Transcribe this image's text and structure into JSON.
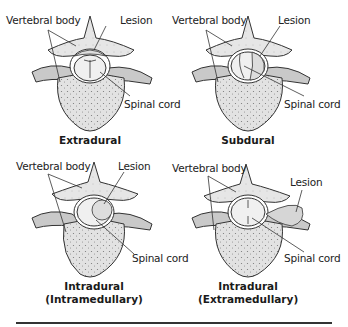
{
  "figure": {
    "panels": [
      {
        "id": "extradural",
        "caption": "Extradural",
        "caption2": "",
        "labels": {
          "vertebral_body": "Vertebral body",
          "lesion": "Lesion",
          "spinal_cord": "Spinal cord"
        }
      },
      {
        "id": "subdural",
        "caption": "Subdural",
        "caption2": "",
        "labels": {
          "vertebral_body": "Vertebral body",
          "lesion": "Lesion",
          "spinal_cord": "Spinal cord"
        }
      },
      {
        "id": "intramedullary",
        "caption": "Intradural",
        "caption2": "(Intramedullary)",
        "labels": {
          "vertebral_body": "Vertebral body",
          "lesion": "Lesion",
          "spinal_cord": "Spinal cord"
        }
      },
      {
        "id": "extramedullary",
        "caption": "Intradural",
        "caption2": "(Extramedullary)",
        "labels": {
          "vertebral_body": "Vertebral body",
          "lesion": "Lesion",
          "spinal_cord": "Spinal cord"
        }
      }
    ],
    "colors": {
      "bone_fill": "#e4e4e4",
      "outline": "#333333",
      "cord_fill": "#f2f2f2",
      "rule": "#333333"
    }
  }
}
